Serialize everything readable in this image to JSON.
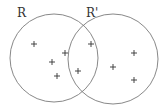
{
  "labels": {
    "left": "R",
    "right": "R'"
  },
  "colors": {
    "stroke": "#7a7a7a",
    "marker": "#333333",
    "background": "#ffffff"
  },
  "circles": [
    {
      "name": "R",
      "cx": 54,
      "cy": 58,
      "r": 44
    },
    {
      "name": "R'",
      "cx": 113,
      "cy": 59,
      "r": 45
    }
  ],
  "points": [
    {
      "x": 34,
      "y": 44
    },
    {
      "x": 65,
      "y": 53
    },
    {
      "x": 52,
      "y": 62
    },
    {
      "x": 57,
      "y": 76
    },
    {
      "x": 78,
      "y": 71
    },
    {
      "x": 91,
      "y": 44
    },
    {
      "x": 113,
      "y": 67
    },
    {
      "x": 134,
      "y": 53
    },
    {
      "x": 134,
      "y": 80
    }
  ]
}
